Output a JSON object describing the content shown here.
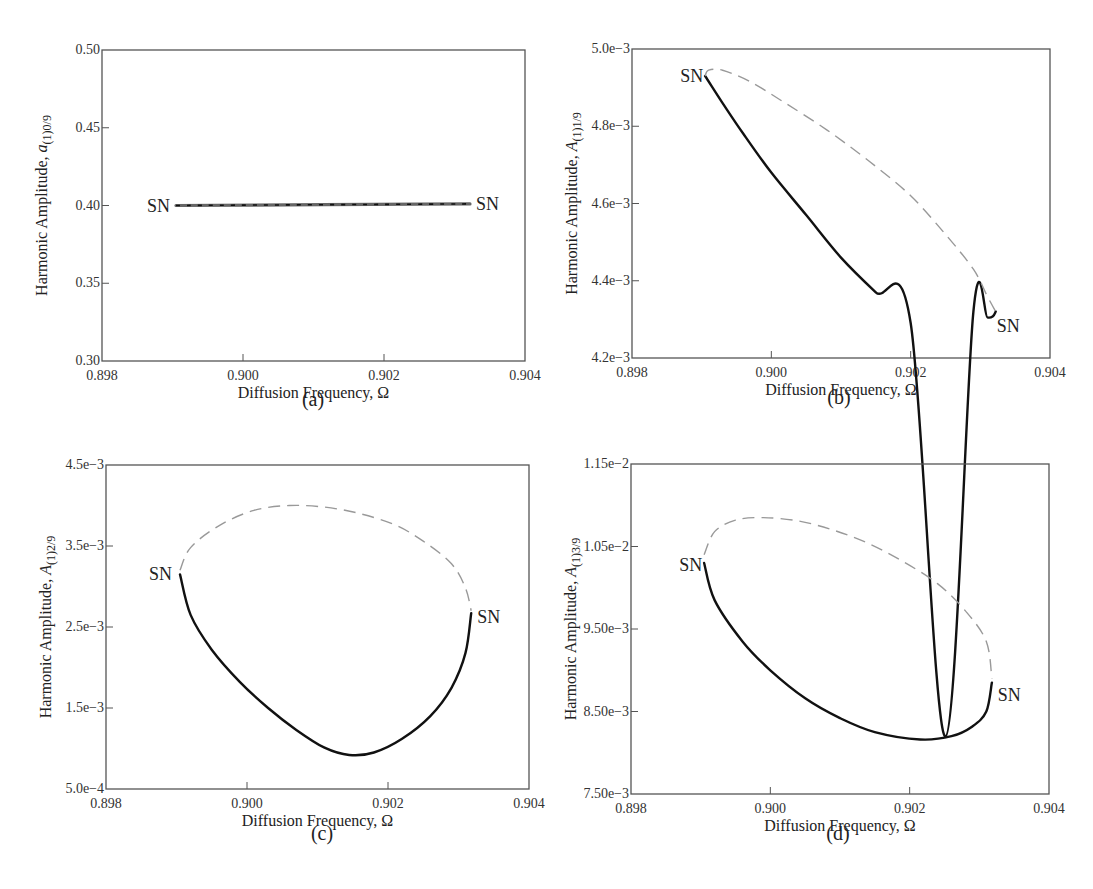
{
  "figure": {
    "panels": [
      {
        "id": "a",
        "caption": "(a)"
      },
      {
        "id": "b",
        "caption": "(b)"
      },
      {
        "id": "c",
        "caption": "(c)"
      },
      {
        "id": "d",
        "caption": "(d)"
      }
    ]
  },
  "chart_data": [
    {
      "type": "line",
      "panel": "(a)",
      "xlabel": "Diffusion Frequency, Ω",
      "ylabel_main": "Harmonic Amplitude, ",
      "ylabel_symbol": "a",
      "ylabel_sub": "(1)0/9",
      "xlim": [
        0.898,
        0.904
      ],
      "ylim": [
        0.3,
        0.5
      ],
      "xticks": [
        0.898,
        0.9,
        0.902,
        0.904
      ],
      "xtick_labels": [
        "0.898",
        "0.900",
        "0.902",
        "0.904"
      ],
      "yticks": [
        0.3,
        0.35,
        0.4,
        0.45,
        0.5
      ],
      "ytick_labels": [
        "0.30",
        "0.35",
        "0.40",
        "0.45",
        "0.50"
      ],
      "grid": false,
      "series": [
        {
          "name": "stable",
          "style": "solid",
          "color": "#666666",
          "x": [
            0.89905,
            0.90322
          ],
          "y": [
            0.4,
            0.401
          ]
        },
        {
          "name": "unstable",
          "style": "dashed",
          "color": "#111111",
          "x": [
            0.89905,
            0.90322
          ],
          "y": [
            0.4,
            0.401
          ]
        }
      ],
      "annotations": [
        {
          "text": "SN",
          "x": 0.89905,
          "y": 0.4,
          "anchor": "end",
          "dx": -6,
          "dy": 6
        },
        {
          "text": "SN",
          "x": 0.90322,
          "y": 0.401,
          "anchor": "start",
          "dx": 6,
          "dy": 6
        }
      ]
    },
    {
      "type": "line",
      "panel": "(b)",
      "xlabel": "Diffusion Frequency, Ω",
      "ylabel_main": "Harmonic Amplitude, ",
      "ylabel_symbol": "A",
      "ylabel_sub": "(1)1/9",
      "xlim": [
        0.898,
        0.904
      ],
      "ylim": [
        0.0042,
        0.005
      ],
      "xticks": [
        0.898,
        0.9,
        0.902,
        0.904
      ],
      "xtick_labels": [
        "0.898",
        "0.900",
        "0.902",
        "0.904"
      ],
      "yticks": [
        0.0042,
        0.0044,
        0.0046,
        0.0048,
        0.005
      ],
      "ytick_labels": [
        "4.2e−3",
        "4.4e−3",
        "4.6e−3",
        "4.8e−3",
        "5.0e−3"
      ],
      "grid": false,
      "series": [
        {
          "name": "stable",
          "style": "solid",
          "color": "#111111",
          "x": [
            0.89905,
            0.8993,
            0.8996,
            0.9,
            0.9005,
            0.901,
            0.9015,
            0.902,
            0.9025,
            0.9029,
            0.9031,
            0.90318,
            0.90322
          ],
          "y": [
            0.00493,
            0.00486,
            0.00478,
            0.00468,
            0.00457,
            0.00446,
            0.00437,
            0.00429,
            0.00322,
            0.00432,
            0.004305,
            0.004308,
            0.00432
          ]
        },
        {
          "name": "unstable",
          "style": "dashed",
          "color": "#999999",
          "x": [
            0.89905,
            0.8991,
            0.8993,
            0.8997,
            0.9002,
            0.9008,
            0.9014,
            0.902,
            0.9025,
            0.9029,
            0.9031,
            0.90322
          ],
          "y": [
            0.00493,
            0.004945,
            0.004945,
            0.004915,
            0.00486,
            0.00479,
            0.00471,
            0.00462,
            0.00452,
            0.00443,
            0.00436,
            0.00432
          ]
        }
      ],
      "annotations": [
        {
          "text": "SN",
          "x": 0.89905,
          "y": 0.00493,
          "anchor": "end",
          "dx": -2,
          "dy": 6
        },
        {
          "text": "SN",
          "x": 0.90322,
          "y": 0.00432,
          "anchor": "start",
          "dx": 1,
          "dy": 20
        }
      ]
    },
    {
      "type": "line",
      "panel": "(c)",
      "xlabel": "Diffusion Frequency, Ω",
      "ylabel_main": "Harmonic Amplitude, ",
      "ylabel_symbol": "A",
      "ylabel_sub": "(1)2/9",
      "xlim": [
        0.898,
        0.904
      ],
      "ylim": [
        0.0005,
        0.0045
      ],
      "xticks": [
        0.898,
        0.9,
        0.902,
        0.904
      ],
      "xtick_labels": [
        "0.898",
        "0.900",
        "0.902",
        "0.904"
      ],
      "yticks": [
        0.0005,
        0.0015,
        0.0025,
        0.0035,
        0.0045
      ],
      "ytick_labels": [
        "5.0e−4",
        "1.5e−3",
        "2.5e−3",
        "3.5e−3",
        "4.5e−3"
      ],
      "grid": false,
      "series": [
        {
          "name": "stable",
          "style": "solid",
          "color": "#111111",
          "x": [
            0.89905,
            0.8992,
            0.8995,
            0.8999,
            0.9003,
            0.9007,
            0.9011,
            0.90145,
            0.9018,
            0.9022,
            0.9026,
            0.9029,
            0.9031,
            0.90318
          ],
          "y": [
            0.00315,
            0.00265,
            0.00222,
            0.00182,
            0.0015,
            0.00123,
            0.00101,
            0.00092,
            0.00095,
            0.00112,
            0.0014,
            0.00175,
            0.00218,
            0.00267
          ]
        },
        {
          "name": "unstable",
          "style": "dashed",
          "color": "#999999",
          "x": [
            0.89905,
            0.8992,
            0.8996,
            0.9001,
            0.9006,
            0.9011,
            0.9016,
            0.9021,
            0.9025,
            0.9029,
            0.9031,
            0.90318
          ],
          "y": [
            0.0032,
            0.00348,
            0.00375,
            0.00394,
            0.004,
            0.00398,
            0.0039,
            0.00376,
            0.00356,
            0.00328,
            0.00298,
            0.0027
          ]
        }
      ],
      "annotations": [
        {
          "text": "SN",
          "x": 0.89905,
          "y": 0.00315,
          "anchor": "end",
          "dx": -8,
          "dy": 6
        },
        {
          "text": "SN",
          "x": 0.90318,
          "y": 0.00262,
          "anchor": "start",
          "dx": 6,
          "dy": 6
        }
      ]
    },
    {
      "type": "line",
      "panel": "(d)",
      "xlabel": "Diffusion Frequency, Ω",
      "ylabel_main": "Harmonic Amplitude, ",
      "ylabel_symbol": "A",
      "ylabel_sub": "(1)3/9",
      "xlim": [
        0.898,
        0.904
      ],
      "ylim": [
        0.0075,
        0.0115
      ],
      "xticks": [
        0.898,
        0.9,
        0.902,
        0.904
      ],
      "xtick_labels": [
        "0.898",
        "0.900",
        "0.902",
        "0.904"
      ],
      "yticks": [
        0.0075,
        0.0085,
        0.0095,
        0.0105,
        0.0115
      ],
      "ytick_labels": [
        "7.50e−3",
        "8.50e−3",
        "9.50e−3",
        "1.05e−2",
        "1.15e−2"
      ],
      "grid": false,
      "series": [
        {
          "name": "stable",
          "style": "solid",
          "color": "#111111",
          "x": [
            0.89905,
            0.8992,
            0.8996,
            0.9,
            0.9005,
            0.901,
            0.9015,
            0.90215,
            0.9026,
            0.9029,
            0.9031,
            0.90318
          ],
          "y": [
            0.0103,
            0.00985,
            0.00935,
            0.009,
            0.00866,
            0.00842,
            0.00825,
            0.00816,
            0.0082,
            0.00832,
            0.0085,
            0.00885
          ]
        },
        {
          "name": "unstable",
          "style": "dashed",
          "color": "#999999",
          "x": [
            0.89905,
            0.8992,
            0.8995,
            0.8999,
            0.9004,
            0.9009,
            0.9014,
            0.9019,
            0.9024,
            0.9028,
            0.9031,
            0.90318
          ],
          "y": [
            0.0104,
            0.01068,
            0.01082,
            0.01085,
            0.01081,
            0.0107,
            0.01054,
            0.01032,
            0.01005,
            0.00972,
            0.00935,
            0.0089
          ]
        }
      ],
      "annotations": [
        {
          "text": "SN",
          "x": 0.89905,
          "y": 0.01028,
          "anchor": "end",
          "dx": -2,
          "dy": 6
        },
        {
          "text": "SN",
          "x": 0.90318,
          "y": 0.0087,
          "anchor": "start",
          "dx": 6,
          "dy": 6
        }
      ]
    }
  ]
}
